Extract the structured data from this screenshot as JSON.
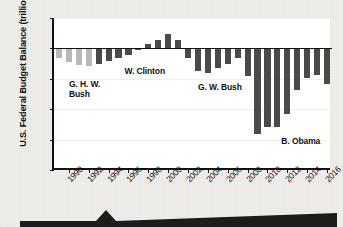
{
  "chart_data": {
    "type": "bar",
    "title": "",
    "subtitle": "",
    "xlabel": "",
    "ylabel": "U.S. Federal Budget Balance (trillions)",
    "ylim": [
      -2.0,
      0.5
    ],
    "ytick_labels": [
      "$0.5",
      "0",
      "-0.5",
      "-1.0",
      "-1.5",
      "-2.0"
    ],
    "ytick_values": [
      0.5,
      0,
      -0.5,
      -1.0,
      -1.5,
      -2.0
    ],
    "xtick_labels": [
      "1990",
      "1992",
      "1994",
      "1996",
      "1998",
      "2000",
      "2002",
      "2004",
      "2006",
      "2008",
      "2010",
      "2012",
      "2014",
      "2016"
    ],
    "xtick_values": [
      1990,
      1992,
      1994,
      1996,
      1998,
      2000,
      2002,
      2004,
      2006,
      2008,
      2010,
      2012,
      2014,
      2016
    ],
    "grid": false,
    "legend": "none",
    "x": [
      1989,
      1990,
      1991,
      1992,
      1993,
      1994,
      1995,
      1996,
      1997,
      1998,
      1999,
      2000,
      2001,
      2002,
      2003,
      2004,
      2005,
      2006,
      2007,
      2008,
      2009,
      2010,
      2011,
      2012,
      2013,
      2014,
      2015,
      2016
    ],
    "values": [
      -0.15,
      -0.22,
      -0.27,
      -0.29,
      -0.26,
      -0.2,
      -0.16,
      -0.11,
      -0.02,
      0.07,
      0.13,
      0.24,
      0.13,
      -0.16,
      -0.38,
      -0.41,
      -0.32,
      -0.25,
      -0.16,
      -0.46,
      -1.41,
      -1.29,
      -1.3,
      -1.08,
      -0.68,
      -0.48,
      -0.44,
      -0.59
    ],
    "bar_colors": [
      "#b9b9b9",
      "#b9b9b9",
      "#b9b9b9",
      "#b9b9b9",
      "#4a4a4a",
      "#4a4a4a",
      "#4a4a4a",
      "#4a4a4a",
      "#4a4a4a",
      "#4a4a4a",
      "#4a4a4a",
      "#4a4a4a",
      "#4a4a4a",
      "#4a4a4a",
      "#4a4a4a",
      "#4a4a4a",
      "#4a4a4a",
      "#4a4a4a",
      "#4a4a4a",
      "#4a4a4a",
      "#4a4a4a",
      "#4a4a4a",
      "#4a4a4a",
      "#4a4a4a",
      "#4a4a4a",
      "#4a4a4a",
      "#4a4a4a",
      "#4a4a4a"
    ],
    "annotations": [
      {
        "text": "G. H. W.\nBush",
        "x_value": 1990,
        "y_value": -0.52
      },
      {
        "text": "W. Clinton",
        "x_value": 1995.6,
        "y_value": -0.3
      },
      {
        "text": "G. W. Bush",
        "x_value": 2003.0,
        "y_value": -0.57
      },
      {
        "text": "B. Obama",
        "x_value": 2011.4,
        "y_value": -1.45
      }
    ]
  },
  "colors": {
    "page_background": "#efedea",
    "plot_background": "#ffffff",
    "axis": "#111111",
    "bar_light": "#b9b9b9",
    "bar_dark": "#4a4a4a",
    "banner": "#1c1c1c"
  },
  "banner": {
    "name": "arrow-banner"
  }
}
